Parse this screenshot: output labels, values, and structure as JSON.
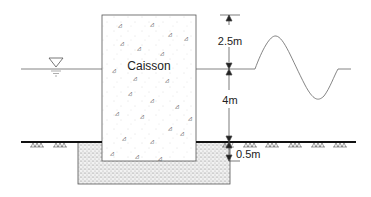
{
  "diagram": {
    "caisson_label": "Caisson",
    "dim_top": "2.5m",
    "dim_mid": "4m",
    "dim_bottom": "0.5m",
    "colors": {
      "stroke": "#444444",
      "ground": "#111111",
      "fill_dots": "#888888"
    }
  }
}
